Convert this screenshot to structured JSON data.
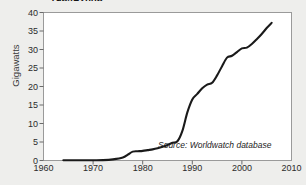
{
  "chart_data": {
    "type": "line",
    "title": "1964–2006",
    "xlabel": "",
    "ylabel": "Gigawatts",
    "xlim": [
      1960,
      2010
    ],
    "ylim": [
      0,
      40
    ],
    "xticks": [
      1960,
      1970,
      1980,
      1990,
      2000,
      2010
    ],
    "yticks": [
      0,
      5,
      10,
      15,
      20,
      25,
      30,
      35,
      40
    ],
    "grid": false,
    "legend": null,
    "annotations": [
      {
        "text": "Source: Worldwatch database",
        "x": 1990,
        "y": 4
      }
    ],
    "series": [
      {
        "name": "Global wind power capacity",
        "color": "#1a1a1a",
        "x": [
          1964,
          1967,
          1970,
          1972,
          1974,
          1976,
          1977,
          1978,
          1979,
          1980,
          1981,
          1982,
          1983,
          1984,
          1985,
          1986,
          1987,
          1988,
          1989,
          1990,
          1991,
          1992,
          1993,
          1994,
          1995,
          1996,
          1997,
          1998,
          1999,
          2000,
          2001,
          2002,
          2003,
          2004,
          2005,
          2006
        ],
        "y": [
          0.05,
          0.05,
          0.07,
          0.1,
          0.3,
          0.8,
          1.6,
          2.4,
          2.5,
          2.6,
          2.8,
          3.0,
          3.3,
          3.7,
          4.2,
          4.8,
          5.2,
          8.0,
          13.0,
          16.5,
          18.0,
          19.5,
          20.5,
          21.0,
          23.0,
          25.5,
          27.8,
          28.3,
          29.3,
          30.3,
          30.5,
          31.5,
          32.8,
          34.2,
          35.8,
          37.2
        ]
      }
    ]
  },
  "axis": {
    "x_labels": [
      "1960",
      "1970",
      "1980",
      "1990",
      "2000",
      "2010"
    ],
    "y_labels": [
      "0",
      "5",
      "10",
      "15",
      "20",
      "25",
      "30",
      "35",
      "40"
    ],
    "y_axis_title": "Gigawatts"
  },
  "note": {
    "text": "Source: Worldwatch database"
  }
}
